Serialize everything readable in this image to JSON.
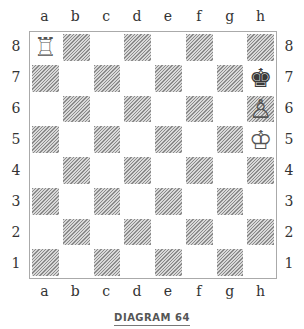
{
  "diagram": {
    "caption": "DIAGRAM 64",
    "files": [
      "a",
      "b",
      "c",
      "d",
      "e",
      "f",
      "g",
      "h"
    ],
    "ranks": [
      "8",
      "7",
      "6",
      "5",
      "4",
      "3",
      "2",
      "1"
    ],
    "pieces": [
      {
        "square": "a8",
        "color": "white",
        "type": "rook",
        "glyph": "♖"
      },
      {
        "square": "h7",
        "color": "black",
        "type": "king",
        "glyph": "♚"
      },
      {
        "square": "h6",
        "color": "white",
        "type": "pawn",
        "glyph": "♙"
      },
      {
        "square": "h5",
        "color": "white",
        "type": "king",
        "glyph": "♔"
      }
    ],
    "colors": {
      "dark_square_hatch": "#8a8a8a",
      "light_square": "#ffffff",
      "border": "#aaaaaa"
    }
  }
}
